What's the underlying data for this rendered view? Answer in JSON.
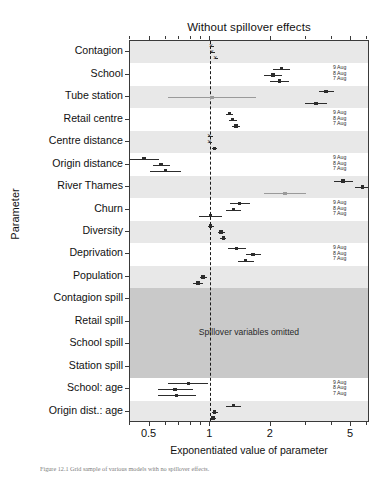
{
  "figure": {
    "caption": "Figure 12.1   Grid sample of various models with no spillover effects."
  },
  "chart_data": {
    "type": "scatter",
    "plot_style": "forest-plot",
    "title": "Without spillover effects",
    "xlabel": "Exponentiated value of parameter",
    "ylabel": "Parameter",
    "xscale": "log",
    "xlim": [
      0.4,
      6.2
    ],
    "xticks": [
      0.5,
      1,
      2,
      5
    ],
    "xtick_labels": [
      "0.5",
      "1",
      "2",
      "5"
    ],
    "reference_line": 1,
    "grid": false,
    "legend_position": "inside-right",
    "legend_entries": [
      "9 Aug",
      "8 Aug",
      "7 Aug"
    ],
    "omitted_band_label": "Spillover variables omitted",
    "categories": [
      "Contagion",
      "School",
      "Tube station",
      "Retail centre",
      "Centre distance",
      "Origin distance",
      "River Thames",
      "Churn",
      "Diversity",
      "Deprivation",
      "Population",
      "Contagion spill",
      "Retail spill",
      "School spill",
      "Station spill",
      "School: age",
      "Origin dist.: age"
    ],
    "series": [
      {
        "name": "9 Aug",
        "values": [
          1.02,
          2.25,
          3.75,
          1.25,
          1.0,
          0.47,
          4.55,
          1.4,
          1.0,
          1.35,
          null,
          null,
          null,
          null,
          null,
          0.78,
          1.3
        ],
        "ci_low": [
          1.0,
          2.05,
          3.45,
          1.2,
          0.98,
          0.4,
          4.1,
          1.25,
          0.97,
          1.22,
          null,
          null,
          null,
          null,
          null,
          0.62,
          1.2
        ],
        "ci_high": [
          1.04,
          2.5,
          4.1,
          1.3,
          1.03,
          0.56,
          5.1,
          1.58,
          1.04,
          1.5,
          null,
          null,
          null,
          null,
          null,
          0.97,
          1.42
        ]
      },
      {
        "name": "8 Aug",
        "values": [
          1.03,
          2.05,
          1.02,
          1.29,
          1.0,
          0.57,
          5.7,
          1.3,
          1.13,
          1.63,
          0.92,
          null,
          null,
          null,
          null,
          0.67,
          1.05
        ],
        "ci_low": [
          1.01,
          1.85,
          0.62,
          1.24,
          0.99,
          0.52,
          5.2,
          1.2,
          1.09,
          1.5,
          0.89,
          null,
          null,
          null,
          null,
          0.55,
          1.02
        ],
        "ci_high": [
          1.06,
          2.28,
          1.68,
          1.35,
          1.02,
          0.63,
          6.2,
          1.42,
          1.18,
          1.78,
          0.96,
          null,
          null,
          null,
          null,
          0.82,
          1.09
        ]
      },
      {
        "name": "7 Aug",
        "values": [
          1.07,
          2.2,
          3.35,
          1.34,
          1.05,
          0.6,
          2.35,
          1.0,
          1.16,
          1.5,
          0.87,
          null,
          null,
          null,
          null,
          0.68,
          1.03
        ],
        "ci_low": [
          1.05,
          1.98,
          2.95,
          1.28,
          1.02,
          0.5,
          1.85,
          0.88,
          1.12,
          1.38,
          0.82,
          null,
          null,
          null,
          null,
          0.55,
          1.0
        ],
        "ci_high": [
          1.09,
          2.45,
          3.8,
          1.4,
          1.08,
          0.72,
          3.0,
          1.15,
          1.2,
          1.65,
          0.92,
          null,
          null,
          null,
          null,
          0.85,
          1.07
        ]
      }
    ]
  }
}
